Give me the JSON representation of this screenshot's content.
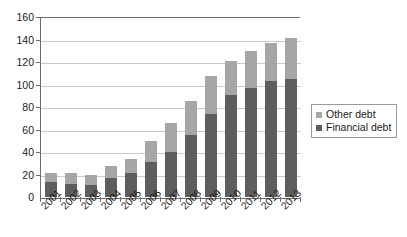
{
  "chart_data": {
    "type": "bar",
    "subtype": "stacked-bar",
    "title": "",
    "xlabel": "",
    "ylabel": "",
    "ylim": [
      0,
      160
    ],
    "ytick_step": 20,
    "yticks": [
      0,
      20,
      40,
      60,
      80,
      100,
      120,
      140,
      160
    ],
    "grid": "horizontal",
    "legend_position": "right",
    "categories": [
      "2001",
      "2002",
      "2003",
      "2004",
      "2005",
      "2006",
      "2007",
      "2008",
      "2009",
      "2010",
      "2011",
      "2012",
      "2013"
    ],
    "series": [
      {
        "name": "Financial debt",
        "color": "#5e5e5e",
        "values": [
          13,
          12,
          11,
          17,
          21,
          31,
          40,
          55,
          74,
          91,
          97,
          103,
          105
        ]
      },
      {
        "name": "Other debt",
        "color": "#a6a6a6",
        "values": [
          8,
          9,
          9,
          11,
          13,
          19,
          26,
          30,
          34,
          30,
          33,
          34,
          36
        ]
      }
    ],
    "totals": [
      21,
      21,
      20,
      28,
      34,
      50,
      66,
      85,
      108,
      121,
      130,
      137,
      141
    ]
  },
  "legend": {
    "items": [
      {
        "label": "Other debt",
        "color": "#a6a6a6"
      },
      {
        "label": "Financial debt",
        "color": "#5e5e5e"
      }
    ]
  },
  "axis": {
    "y_labels": [
      "160",
      "140",
      "120",
      "100",
      "80",
      "60",
      "40",
      "20",
      "0"
    ]
  }
}
